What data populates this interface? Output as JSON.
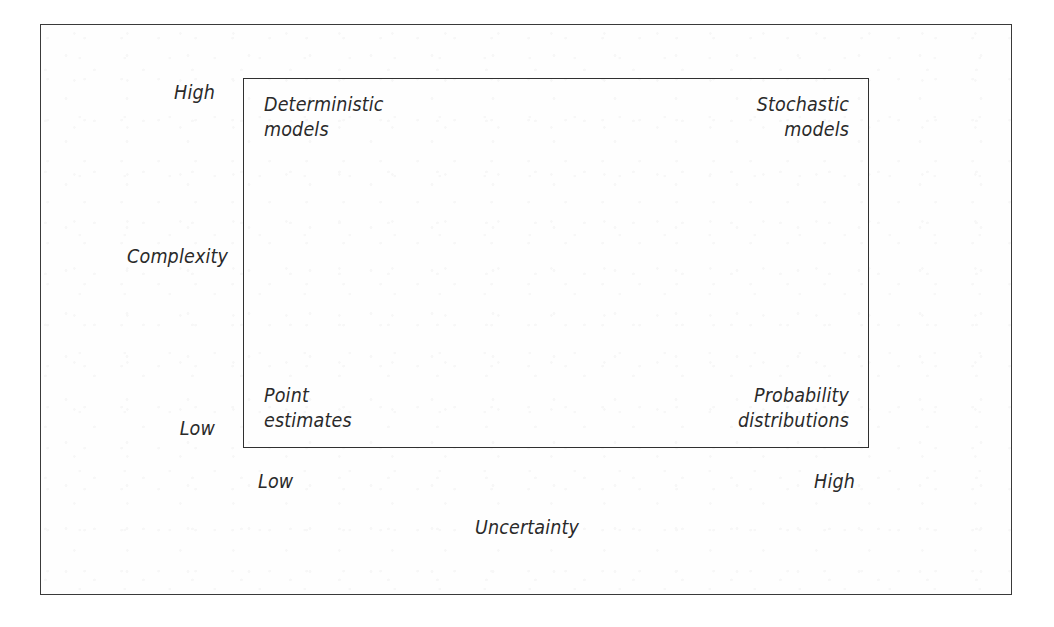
{
  "figure": {
    "type": "quadrant-matrix",
    "background_color": "#ffffff",
    "line_color": "#303030",
    "text_color": "#2a2a2a"
  },
  "axes": {
    "x": {
      "title": "Uncertainty",
      "tick_low": "Low",
      "tick_high": "High"
    },
    "y": {
      "title": "Complexity",
      "tick_low": "Low",
      "tick_high": "High"
    }
  },
  "quadrants": {
    "top_left": "Deterministic\nmodels",
    "top_right": "Stochastic\nmodels",
    "bottom_left": "Point\nestimates",
    "bottom_right": "Probability\ndistributions"
  },
  "chart_data": {
    "type": "scatter",
    "title": "",
    "xlabel": "Uncertainty",
    "ylabel": "Complexity",
    "grid": false,
    "legend": "none",
    "xlim": [
      "Low",
      "High"
    ],
    "ylim": [
      "Low",
      "High"
    ],
    "xticklabels": [
      "Low",
      "High"
    ],
    "yticklabels": [
      "Low",
      "High"
    ],
    "annotations": [
      {
        "x": "Low",
        "y": "High",
        "position": "top-left",
        "text": "Deterministic models"
      },
      {
        "x": "High",
        "y": "High",
        "position": "top-right",
        "text": "Stochastic models"
      },
      {
        "x": "Low",
        "y": "Low",
        "position": "bottom-left",
        "text": "Point estimates"
      },
      {
        "x": "High",
        "y": "Low",
        "position": "bottom-right",
        "text": "Probability distributions"
      }
    ]
  }
}
